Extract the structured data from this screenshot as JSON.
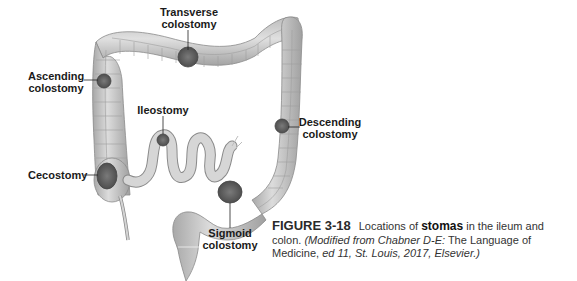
{
  "figure": {
    "labels": {
      "transverse": [
        "Transverse",
        "colostomy"
      ],
      "ascending": [
        "Ascending",
        "colostomy"
      ],
      "ileostomy": [
        "Ileostomy"
      ],
      "descending": [
        "Descending",
        "colostomy"
      ],
      "cecostomy": [
        "Cecostomy"
      ],
      "sigmoid": [
        "Sigmoid",
        "colostomy"
      ]
    },
    "caption": {
      "number": "FIGURE 3-18",
      "text_before": "Locations of ",
      "keyword": "stomas",
      "text_after": " in the ileum and colon. ",
      "source_italic_1": "(Modified from Chabner D-E:",
      "source_plain": " The Language of Medicine,",
      "source_italic_2": " ed 11, St. Louis, 2017, Elsevier.)"
    },
    "colors": {
      "bowel_fill": "#cfcfcf",
      "bowel_shadow": "#9a9a9a",
      "stoma_fill": "#6e6e6e",
      "label_text": "#1a1a1a",
      "caption_text": "#333333"
    }
  }
}
